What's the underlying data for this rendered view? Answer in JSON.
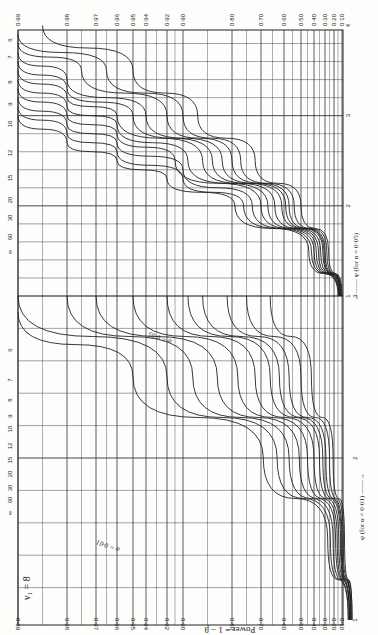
{
  "chart_data": {
    "type": "line",
    "orientation": "rotated 90° (power axis horizontal across page, φ axis vertical along right edge)",
    "nu1_label": "ν₁ = 8",
    "nu1_label_alt": "ν₁ = 60 ∞",
    "ylabel": "Power = 1 − β",
    "xlabel_alpha05": "φ (for α = 0·05)",
    "xlabel_alpha01": "φ (for α = 0·01)",
    "alpha05_curve_tag": "α = 0·05",
    "alpha01_curve_tag": "α = 0·01",
    "power_ticks": [
      "0·99",
      "0·98",
      "0·97",
      "0·96",
      "0·95",
      "0·94",
      "0·92",
      "0·90",
      "0·80",
      "0·70",
      "0·60",
      "0·50",
      "0·40",
      "0·30",
      "0·20",
      "0·10"
    ],
    "power_tick_values": [
      0.99,
      0.98,
      0.97,
      0.96,
      0.95,
      0.94,
      0.92,
      0.9,
      0.8,
      0.7,
      0.6,
      0.5,
      0.4,
      0.3,
      0.2,
      0.1
    ],
    "phi_ticks_alpha05": [
      "1",
      "2",
      "3",
      "4"
    ],
    "phi_ticks_alpha01": [
      "1",
      "2",
      "3"
    ],
    "nu2_values": [
      "6",
      "7",
      "8",
      "9",
      "10",
      "12",
      "15",
      "20",
      "30",
      "60",
      "∞"
    ],
    "grid": true,
    "series_alpha05": [
      {
        "name": "ν2=6",
        "phi": [
          1.0,
          1.5,
          2.0,
          2.5,
          3.0,
          3.5,
          4.0
        ],
        "power": [
          0.1,
          0.26,
          0.5,
          0.72,
          0.87,
          0.95,
          0.985
        ]
      },
      {
        "name": "ν2=7",
        "phi": [
          1.0,
          1.5,
          2.0,
          2.5,
          3.0,
          3.5,
          3.9
        ],
        "power": [
          0.11,
          0.28,
          0.54,
          0.77,
          0.9,
          0.965,
          0.99
        ]
      },
      {
        "name": "ν2=8",
        "phi": [
          1.0,
          1.5,
          2.0,
          2.5,
          3.0,
          3.5,
          3.8
        ],
        "power": [
          0.11,
          0.3,
          0.57,
          0.8,
          0.92,
          0.975,
          0.99
        ]
      },
      {
        "name": "ν2=9",
        "phi": [
          1.0,
          1.5,
          2.0,
          2.5,
          3.0,
          3.4,
          3.7
        ],
        "power": [
          0.12,
          0.31,
          0.59,
          0.82,
          0.94,
          0.98,
          0.99
        ]
      },
      {
        "name": "ν2=10",
        "phi": [
          1.0,
          1.5,
          2.0,
          2.5,
          3.0,
          3.3,
          3.6
        ],
        "power": [
          0.12,
          0.32,
          0.61,
          0.84,
          0.95,
          0.98,
          0.99
        ]
      },
      {
        "name": "ν2=12",
        "phi": [
          1.0,
          1.5,
          2.0,
          2.5,
          3.0,
          3.2,
          3.5
        ],
        "power": [
          0.12,
          0.34,
          0.64,
          0.86,
          0.96,
          0.98,
          0.99
        ]
      },
      {
        "name": "ν2=15",
        "phi": [
          1.0,
          1.5,
          2.0,
          2.5,
          2.9,
          3.1,
          3.4
        ],
        "power": [
          0.13,
          0.36,
          0.67,
          0.89,
          0.96,
          0.98,
          0.99
        ]
      },
      {
        "name": "ν2=20",
        "phi": [
          1.0,
          1.5,
          2.0,
          2.5,
          2.8,
          3.0,
          3.3
        ],
        "power": [
          0.13,
          0.38,
          0.7,
          0.91,
          0.96,
          0.98,
          0.99
        ]
      },
      {
        "name": "ν2=30",
        "phi": [
          1.0,
          1.5,
          2.0,
          2.4,
          2.7,
          2.9,
          3.2
        ],
        "power": [
          0.14,
          0.4,
          0.73,
          0.9,
          0.96,
          0.98,
          0.99
        ]
      },
      {
        "name": "ν2=60",
        "phi": [
          1.0,
          1.5,
          2.0,
          2.3,
          2.6,
          2.8,
          3.1
        ],
        "power": [
          0.14,
          0.42,
          0.76,
          0.9,
          0.96,
          0.98,
          0.99
        ]
      },
      {
        "name": "ν2=∞",
        "phi": [
          1.0,
          1.5,
          2.0,
          2.3,
          2.5,
          2.7,
          3.0
        ],
        "power": [
          0.15,
          0.44,
          0.79,
          0.92,
          0.96,
          0.98,
          0.99
        ]
      }
    ],
    "series_alpha01": [
      {
        "name": "ν2=6",
        "phi": [
          1.0,
          1.5,
          2.0,
          2.5,
          3.0
        ],
        "power": [
          0.02,
          0.08,
          0.21,
          0.42,
          0.66
        ]
      },
      {
        "name": "ν2=7",
        "phi": [
          1.0,
          1.5,
          2.0,
          2.5,
          3.0
        ],
        "power": [
          0.02,
          0.09,
          0.25,
          0.5,
          0.75
        ]
      },
      {
        "name": "ν2=8",
        "phi": [
          1.0,
          1.5,
          2.0,
          2.5,
          3.0
        ],
        "power": [
          0.03,
          0.1,
          0.29,
          0.57,
          0.81
        ]
      },
      {
        "name": "ν2=9",
        "phi": [
          1.0,
          1.5,
          2.0,
          2.5,
          3.0
        ],
        "power": [
          0.03,
          0.11,
          0.32,
          0.62,
          0.86
        ]
      },
      {
        "name": "ν2=10",
        "phi": [
          1.0,
          1.5,
          2.0,
          2.5,
          3.0
        ],
        "power": [
          0.03,
          0.12,
          0.35,
          0.66,
          0.89
        ]
      },
      {
        "name": "ν2=12",
        "phi": [
          1.0,
          1.5,
          2.0,
          2.5,
          3.0
        ],
        "power": [
          0.03,
          0.14,
          0.4,
          0.72,
          0.92
        ]
      },
      {
        "name": "ν2=15",
        "phi": [
          1.0,
          1.5,
          2.0,
          2.5,
          3.0
        ],
        "power": [
          0.04,
          0.16,
          0.45,
          0.78,
          0.95
        ]
      },
      {
        "name": "ν2=20",
        "phi": [
          1.0,
          1.5,
          2.0,
          2.5,
          3.0
        ],
        "power": [
          0.04,
          0.18,
          0.51,
          0.83,
          0.97
        ]
      },
      {
        "name": "ν2=30",
        "phi": [
          1.0,
          1.5,
          2.0,
          2.5,
          3.0
        ],
        "power": [
          0.04,
          0.21,
          0.57,
          0.88,
          0.98
        ]
      },
      {
        "name": "ν2=60",
        "phi": [
          1.0,
          1.5,
          2.0,
          2.5,
          3.0
        ],
        "power": [
          0.05,
          0.24,
          0.63,
          0.92,
          0.99
        ]
      },
      {
        "name": "ν2=∞",
        "phi": [
          1.0,
          1.5,
          2.0,
          2.5,
          2.9
        ],
        "power": [
          0.05,
          0.27,
          0.69,
          0.95,
          0.99
        ]
      }
    ],
    "legend_position": "curve labels placed inline along curves"
  }
}
